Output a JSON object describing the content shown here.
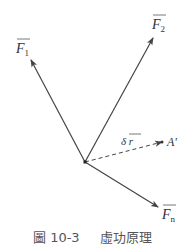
{
  "figure": {
    "caption_number": "圖 10-3",
    "caption_title": "虛功原理",
    "origin": {
      "x": 85,
      "y": 162
    },
    "vectors": [
      {
        "name": "F1",
        "symbol": "F",
        "subscript": "1",
        "tip": {
          "x": 31,
          "y": 60
        }
      },
      {
        "name": "F2",
        "symbol": "F",
        "subscript": "2",
        "tip": {
          "x": 153,
          "y": 38
        }
      },
      {
        "name": "Fn",
        "symbol": "F",
        "subscript": "n",
        "tip": {
          "x": 158,
          "y": 207
        }
      }
    ],
    "displacement": {
      "symbol": "δ r",
      "target_label": "A'",
      "tip": {
        "x": 163,
        "y": 142
      }
    },
    "colors": {
      "line": "#444444",
      "text": "#333333",
      "caption": "#555555"
    }
  }
}
